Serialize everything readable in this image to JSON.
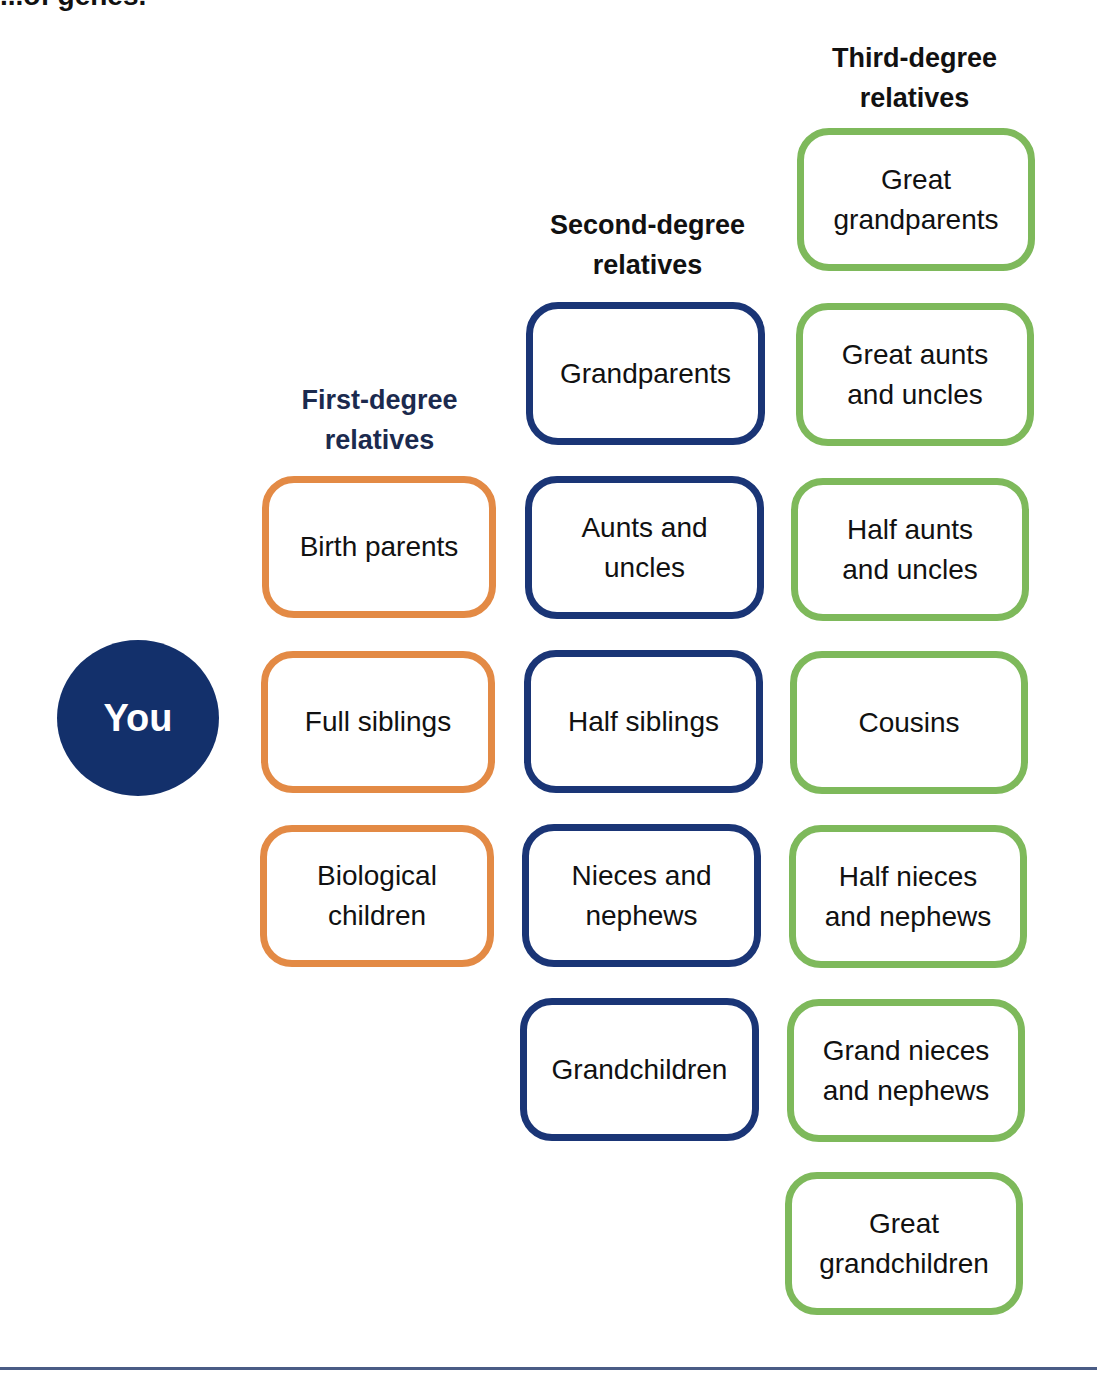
{
  "header": {
    "cut_title": "...of genes."
  },
  "colors": {
    "first_degree": "#e38a45",
    "second_degree": "#1a3576",
    "third_degree": "#7eb95b",
    "you_fill": "#13306b"
  },
  "center": {
    "label": "You"
  },
  "columns": [
    {
      "heading_line1": "First-degree",
      "heading_line2": "relatives",
      "items": [
        "Birth parents",
        "Full siblings",
        "Biological children"
      ]
    },
    {
      "heading_line1": "Second-degree",
      "heading_line2": "relatives",
      "items": [
        "Grandparents",
        "Aunts and uncles",
        "Half siblings",
        "Nieces and nephews",
        "Grandchildren"
      ]
    },
    {
      "heading_line1": "Third-degree",
      "heading_line2": "relatives",
      "items": [
        "Great grandparents",
        "Great aunts and uncles",
        "Half aunts and uncles",
        "Cousins",
        "Half nieces and nephews",
        "Grand nieces and nephews",
        "Great grandchildren"
      ]
    }
  ]
}
